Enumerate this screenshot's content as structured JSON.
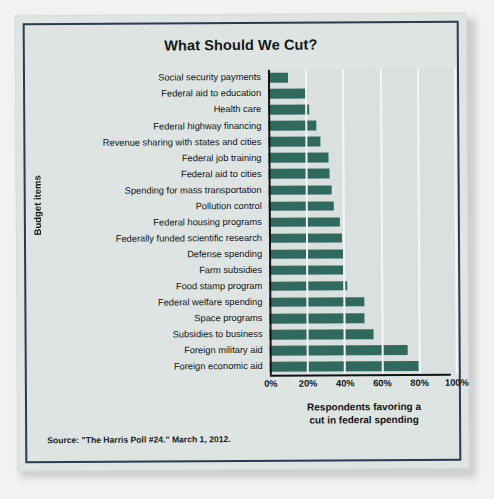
{
  "figure": {
    "title": "What Should We Cut?",
    "source_note": "Source: \"The Harris Poll #24.\" March 1, 2012.",
    "frame_color": "#2b3b52",
    "panel_color": "#d9e0de",
    "bar_color": "#2f6a5c",
    "gridline_color": "#f4f7f6",
    "axis_color": "#111214"
  },
  "chart_data": {
    "type": "bar",
    "orientation": "horizontal",
    "title": "What Should We Cut?",
    "xlabel": "Respondents favoring a cut in federal spending",
    "ylabel": "Budget items",
    "xlim": [
      0,
      100
    ],
    "xunit": "%",
    "xticks": [
      0,
      20,
      40,
      60,
      80,
      100
    ],
    "xticklabels": [
      "0%",
      "20%",
      "40%",
      "60%",
      "80%",
      "100%"
    ],
    "grid": true,
    "grid_axis": "x",
    "legend": null,
    "categories": [
      "Social security payments",
      "Federal aid to education",
      "Health care",
      "Federal highway financing",
      "Revenue sharing with states and cities",
      "Federal job training",
      "Federal aid to cities",
      "Spending for mass transportation",
      "Pollution control",
      "Federal housing programs",
      "Federally funded scientific research",
      "Defense spending",
      "Farm subsidies",
      "Food stamp program",
      "Federal welfare spending",
      "Space programs",
      "Subsidies to business",
      "Foreign military aid",
      "Foreign economic aid"
    ],
    "values": [
      11,
      21,
      22,
      26,
      28,
      32,
      33,
      34,
      35,
      38,
      39,
      40,
      40,
      42,
      51,
      51,
      56,
      74,
      80
    ]
  },
  "axis_titles": {
    "x": [
      "Respondents favoring a",
      "cut in federal spending"
    ],
    "y": "Budget items"
  }
}
